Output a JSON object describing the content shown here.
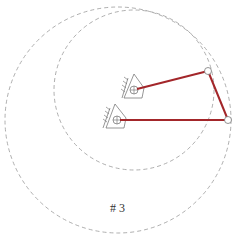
{
  "diagram": {
    "label": "# 3",
    "colors": {
      "link": "#a3262a",
      "circle": "#9a9a9a",
      "ground": "#6a6a6a",
      "joint_fill": "#ffffff",
      "joint_stroke": "#777777"
    },
    "pivots": [
      {
        "name": "upper-pivot",
        "x": 134,
        "y": 90
      },
      {
        "name": "lower-pivot",
        "x": 117,
        "y": 120
      }
    ],
    "joints": [
      {
        "name": "joint-a",
        "x": 208,
        "y": 71
      },
      {
        "name": "joint-b",
        "x": 228,
        "y": 120
      }
    ],
    "circles": [
      {
        "name": "large-trace-circle",
        "cx": 118,
        "cy": 120,
        "r": 113
      },
      {
        "name": "small-trace-circle",
        "cx": 134,
        "cy": 90,
        "r": 80
      }
    ]
  }
}
